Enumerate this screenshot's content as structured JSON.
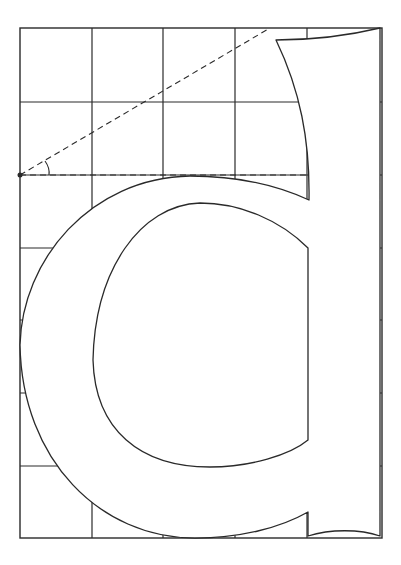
{
  "figure": {
    "title": "Construction of the lowercase letter d on a square grid",
    "letter": "d",
    "colors": {
      "line": "#2a2a2a",
      "background": "#ffffff"
    }
  },
  "grid": {
    "frame": {
      "x": 20,
      "y": 28,
      "width": 362,
      "height": 510
    },
    "vertical_lines_x": [
      92,
      163,
      235,
      307
    ],
    "horizontal_lines_y": [
      102,
      175,
      248,
      320,
      393,
      466
    ]
  },
  "glyph": {
    "outer_path": "M 380 28 Q 330 40 276 40 C 300 90 310 140 309 200 C 270 182 230 176 190 176 C 90 178 22 260 20 345 C 22 460 100 538 195 538 C 240 538 280 528 308 512 L 308 536 C 330 529 360 529 380 536 Z",
    "counter_path": "M 308 248 C 280 220 240 203 200 203 C 140 205 95 270 93 360 C 95 430 140 467 210 467 C 250 467 290 455 308 440 Z"
  },
  "construction": {
    "pivot": {
      "x": 20,
      "y": 175
    },
    "diagonal": {
      "x1": 20,
      "y1": 175,
      "x2": 270,
      "y2": 28
    },
    "baseline_dashed": {
      "x1": 20,
      "y1": 175,
      "x2": 308,
      "y2": 175
    },
    "angle_arc": "M 45 161 Q 50 168 49 175"
  }
}
